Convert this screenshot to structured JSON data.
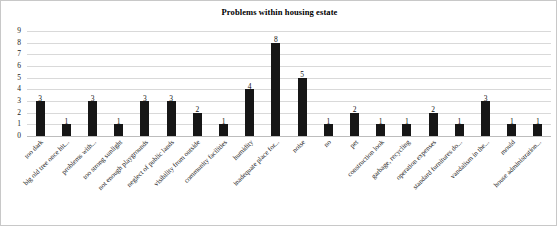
{
  "chart_data": {
    "type": "bar",
    "title": "Problems within housing estate",
    "xlabel": "",
    "ylabel": "",
    "ylim": [
      0,
      9
    ],
    "yticks": [
      0,
      1,
      2,
      3,
      4,
      5,
      6,
      7,
      8,
      9
    ],
    "grid": true,
    "legend": null,
    "bar_color": "#161616",
    "categories": [
      "too dark",
      "big old tree once hit...",
      "problems with...",
      "too strong sunlight",
      "not enough playgrounds",
      "neglect of public lands",
      "visibility from outside",
      "community facilities",
      "humidity",
      "inadequate place for...",
      "noise",
      "no",
      "pet",
      "construction look",
      "garbage, recycling",
      "operation expenses",
      "standard furnitures do...",
      "vandalism in the...",
      "mould",
      "house administration..."
    ],
    "values": [
      3,
      1,
      3,
      1,
      3,
      3,
      2,
      1,
      4,
      8,
      5,
      1,
      2,
      1,
      1,
      2,
      1,
      3,
      1,
      1
    ]
  }
}
